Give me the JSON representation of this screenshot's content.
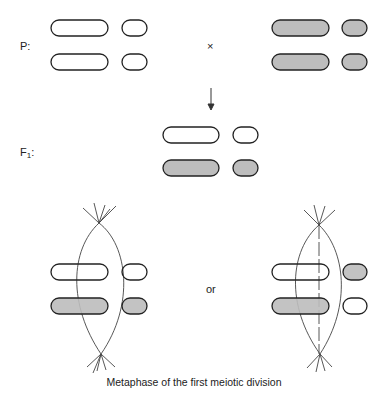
{
  "labels": {
    "parental": "P:",
    "cross": "×",
    "f1_main": "F",
    "f1_sub": "1",
    "f1_colon": ":",
    "or": "or",
    "caption": "Metaphase of the first meiotic division"
  },
  "colors": {
    "outline": "#222222",
    "shaded_fill": "#bdbdbd",
    "unshaded_fill": "#ffffff",
    "spindle": "#444444"
  },
  "rows": {
    "parent_left": [
      "unshaded",
      "unshaded"
    ],
    "parent_right": [
      "shaded",
      "shaded"
    ],
    "f1": [
      "unshaded",
      "shaded"
    ],
    "metaphase_option_1": {
      "top": [
        "unshaded",
        "unshaded"
      ],
      "bottom": [
        "shaded",
        "shaded"
      ]
    },
    "metaphase_option_2": {
      "top": [
        "unshaded",
        "shaded"
      ],
      "bottom": [
        "shaded",
        "unshaded"
      ]
    }
  }
}
